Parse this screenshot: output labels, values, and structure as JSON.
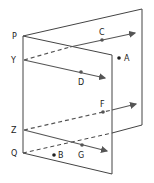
{
  "diagram": {
    "colors": {
      "plane": "#444444",
      "line": "#555555",
      "text": "#222222"
    },
    "labels": {
      "P": "P",
      "Y": "Y",
      "Z": "Z",
      "Q": "Q",
      "A": "A",
      "B": "B",
      "C": "C",
      "D": "D",
      "F": "F",
      "G": "G"
    },
    "planes": [
      {
        "name": "back-plane",
        "points": [
          [
            23,
            36
          ],
          [
            142,
            9
          ],
          [
            142,
            125
          ],
          [
            23,
            153
          ]
        ]
      },
      {
        "name": "front-plane",
        "points": [
          [
            23,
            36
          ],
          [
            112,
            55
          ],
          [
            112,
            174
          ],
          [
            23,
            153
          ]
        ]
      }
    ],
    "lines": [
      {
        "name": "line-YC",
        "from": "Y",
        "through": "C"
      },
      {
        "name": "line-YD",
        "from": "Y",
        "through": "D"
      },
      {
        "name": "line-ZF",
        "from": "Z",
        "through": "F"
      },
      {
        "name": "line-ZG",
        "from": "Z",
        "through": "G"
      },
      {
        "name": "line-Q",
        "from": "Q",
        "note": "dashed line along back plane"
      }
    ],
    "points": [
      "A",
      "B"
    ]
  }
}
